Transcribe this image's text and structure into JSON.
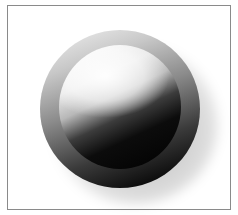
{
  "figure": {
    "colors": {
      "background": "#ffffff",
      "frame_border": "#8a8a8a",
      "highlight": "#ffffff",
      "shadow": "#000000"
    }
  }
}
